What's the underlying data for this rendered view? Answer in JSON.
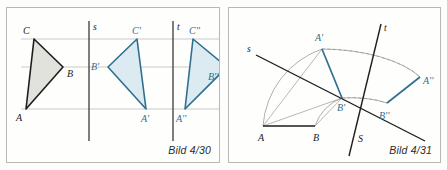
{
  "figure": {
    "accent_blue": "#2f6f90",
    "ink_dark": "#222222",
    "guide_gray": "#b4b4b0",
    "fill_gray": "#e2e2dd",
    "fill_blue": "#dcebf1"
  },
  "panels": [
    {
      "id": "left",
      "caption": "Bild 4/30",
      "description": "Triangle ABC reflected across vertical axis s to A'B'C', then across vertical axis t to A''B''C''",
      "axes": [
        {
          "name": "s",
          "label": "s",
          "type": "vertical-mirror-line",
          "x": 88
        },
        {
          "name": "t",
          "label": "t",
          "type": "vertical-mirror-line",
          "x": 172
        }
      ],
      "guide_lines_y": [
        38,
        66,
        108
      ],
      "triangles": [
        {
          "name": "original",
          "style": "dark",
          "vertices": [
            {
              "label": "C",
              "x": 33,
              "y": 38,
              "label_dx": -11,
              "label_dy": -5
            },
            {
              "label": "B",
              "x": 62,
              "y": 66,
              "label_dx": 4,
              "label_dy": 10
            },
            {
              "label": "A",
              "x": 25,
              "y": 108,
              "label_dx": -10,
              "label_dy": 12
            }
          ]
        },
        {
          "name": "first-image",
          "style": "blue",
          "vertices": [
            {
              "label": "C'",
              "x": 136,
              "y": 38,
              "label_dx": -5,
              "label_dy": -5
            },
            {
              "label": "B'",
              "x": 107,
              "y": 66,
              "label_dx": -17,
              "label_dy": 1
            },
            {
              "label": "A'",
              "x": 145,
              "y": 108,
              "label_dx": -4,
              "label_dy": 12
            }
          ]
        },
        {
          "name": "second-image",
          "style": "blue",
          "vertices": [
            {
              "label": "C''",
              "x": 192,
              "y": 38,
              "label_dx": -5,
              "label_dy": -5
            },
            {
              "label": "B''",
              "x": 226,
              "y": 66,
              "label_dx": -14,
              "label_dy": 12
            },
            {
              "label": "A''",
              "x": 184,
              "y": 108,
              "label_dx": -5,
              "label_dy": 12
            }
          ]
        }
      ]
    },
    {
      "id": "right",
      "caption": "Bild 4/31",
      "description": "Segment AB rotated about point S: first about line s to A'B', then about line t to A''B''",
      "axes": [
        {
          "name": "s",
          "label": "s",
          "type": "oblique-rotation-axis"
        },
        {
          "name": "t",
          "label": "t",
          "type": "oblique-rotation-axis"
        },
        {
          "name": "S",
          "label": "S",
          "type": "intersection-point"
        }
      ],
      "points": [
        {
          "label": "A",
          "style": "dark",
          "x": 34,
          "y": 118
        },
        {
          "label": "B",
          "style": "dark",
          "x": 86,
          "y": 118
        },
        {
          "label": "A'",
          "style": "blue",
          "x": 93,
          "y": 41
        },
        {
          "label": "B'",
          "style": "blue",
          "x": 113,
          "y": 90
        },
        {
          "label": "A''",
          "style": "blue",
          "x": 191,
          "y": 69
        },
        {
          "label": "B''",
          "style": "blue",
          "x": 158,
          "y": 95
        },
        {
          "label": "S",
          "style": "dark",
          "x": 146,
          "y": 119
        }
      ]
    }
  ]
}
